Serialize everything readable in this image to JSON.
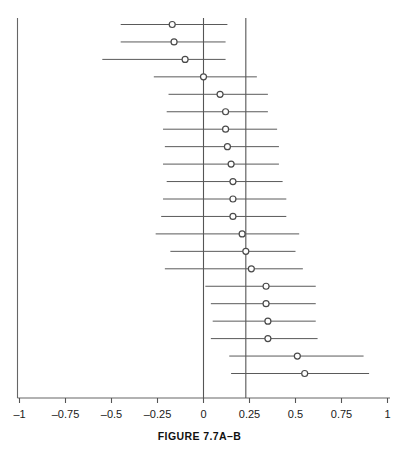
{
  "figure": {
    "caption": "FIGURE 7.7A–B"
  },
  "axis": {
    "tick_labels": [
      "–1",
      "–0.75",
      "–0.5",
      "–0.25",
      "0",
      "0.25",
      "0.5",
      "0.75",
      "1"
    ],
    "tick_values": [
      -1,
      -0.75,
      -0.5,
      -0.25,
      0,
      0.25,
      0.5,
      0.75,
      1
    ],
    "line_color": "#555555",
    "axis_label": ""
  },
  "reference_lines": {
    "null_line_value": 0,
    "summary_line_value": 0.23,
    "color": "#555555"
  },
  "marker": {
    "fill_color": "#ffffff",
    "stroke_color": "#4a4a4a",
    "radius": 3
  },
  "chart_data": {
    "type": "scatter",
    "title": "",
    "subtitle": "",
    "xlabel": "",
    "ylabel": "",
    "xlim": [
      -1,
      1
    ],
    "grid": false,
    "legend": "none",
    "orientation": "horizontal-forest-plot",
    "x": [
      -0.17,
      -0.16,
      -0.1,
      0.0,
      0.09,
      0.12,
      0.12,
      0.13,
      0.15,
      0.16,
      0.16,
      0.16,
      0.21,
      0.23,
      0.26,
      0.34,
      0.34,
      0.35,
      0.35,
      0.51,
      0.55
    ],
    "ci_low": [
      -0.45,
      -0.45,
      -0.55,
      -0.27,
      -0.19,
      -0.2,
      -0.22,
      -0.21,
      -0.22,
      -0.2,
      -0.22,
      -0.23,
      -0.26,
      -0.18,
      -0.21,
      0.01,
      0.04,
      0.05,
      0.04,
      0.14,
      0.15
    ],
    "ci_high": [
      0.13,
      0.12,
      0.12,
      0.29,
      0.35,
      0.35,
      0.4,
      0.41,
      0.41,
      0.43,
      0.45,
      0.45,
      0.52,
      0.5,
      0.54,
      0.61,
      0.61,
      0.61,
      0.62,
      0.87,
      0.9
    ],
    "categories": [
      "study-1",
      "study-2",
      "study-3",
      "study-4",
      "study-5",
      "study-6",
      "study-7",
      "study-8",
      "study-9",
      "study-10",
      "study-11",
      "study-12",
      "study-13",
      "study-14",
      "study-15",
      "study-16",
      "study-17",
      "study-18",
      "study-19",
      "study-20",
      "study-21"
    ],
    "values": [
      -0.17,
      -0.16,
      -0.1,
      0.0,
      0.09,
      0.12,
      0.12,
      0.13,
      0.15,
      0.16,
      0.16,
      0.16,
      0.21,
      0.23,
      0.26,
      0.34,
      0.34,
      0.35,
      0.35,
      0.51,
      0.55
    ]
  }
}
